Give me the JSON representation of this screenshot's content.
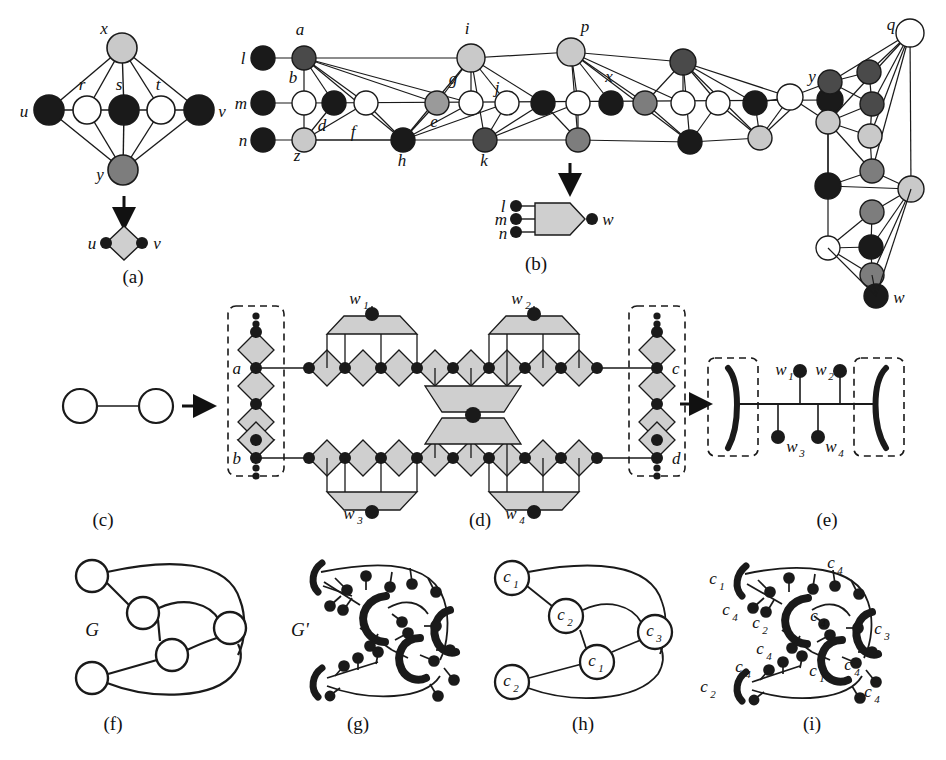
{
  "figure": {
    "background": "#ffffff",
    "width": 946,
    "height": 760
  },
  "palette": {
    "black": "#1a1a1a",
    "dark_gray": "#4a4a4a",
    "mid_gray": "#7d7d7d",
    "light_gray": "#c9c9c9",
    "pale_gray": "#d8d8d8",
    "white": "#ffffff",
    "stroke": "#1a1a1a",
    "gadget_fill": "#cfcfcf"
  },
  "panels": [
    {
      "id": "a",
      "label": "(a)",
      "x": 133,
      "y": 262
    },
    {
      "id": "b",
      "label": "(b)",
      "x": 536,
      "y": 262
    },
    {
      "id": "c",
      "label": "(c)",
      "x": 103,
      "y": 519
    },
    {
      "id": "d",
      "label": "(d)",
      "x": 480,
      "y": 519
    },
    {
      "id": "e",
      "label": "(e)",
      "x": 827,
      "y": 519
    },
    {
      "id": "f",
      "label": "(f)",
      "x": 113,
      "y": 723
    },
    {
      "id": "g",
      "label": "(g)",
      "x": 358,
      "y": 723
    },
    {
      "id": "h",
      "label": "(h)",
      "x": 583,
      "y": 723
    },
    {
      "id": "i",
      "label": "(i)",
      "x": 812,
      "y": 723
    }
  ],
  "panel_a": {
    "caption": "(a)",
    "nodes": [
      {
        "name": "x",
        "label": "x",
        "cx": 122,
        "cy": 48,
        "r": 15,
        "fill": "#c9c9c9",
        "label_x": 102,
        "label_y": 32
      },
      {
        "name": "u",
        "label": "u",
        "cx": 49,
        "cy": 110,
        "r": 15,
        "fill": "#1a1a1a",
        "label_x": 22,
        "label_y": 117
      },
      {
        "name": "r",
        "label": "r",
        "cx": 87,
        "cy": 110,
        "r": 14,
        "fill": "#ffffff",
        "label_x": 79,
        "label_y": 88
      },
      {
        "name": "s",
        "label": "s",
        "cx": 124,
        "cy": 110,
        "r": 15,
        "fill": "#1a1a1a",
        "label_x": 116,
        "label_y": 88
      },
      {
        "name": "t",
        "label": "t",
        "cx": 161,
        "cy": 110,
        "r": 14,
        "fill": "#ffffff",
        "label_x": 155,
        "label_y": 88
      },
      {
        "name": "v",
        "label": "v",
        "cx": 199,
        "cy": 110,
        "r": 15,
        "fill": "#1a1a1a",
        "label_x": 219,
        "label_y": 117
      },
      {
        "name": "y",
        "label": "y",
        "cx": 123,
        "cy": 170,
        "r": 15,
        "fill": "#7d7d7d",
        "label_x": 98,
        "label_y": 180
      }
    ],
    "arrow": {
      "x": 124,
      "y1": 196,
      "y2": 224
    },
    "result": {
      "left_label": "u",
      "right_label": "v",
      "left_x": 92,
      "right_x": 158,
      "y": 243,
      "diamond_cx": 124,
      "diamond_cy": 243,
      "diamond_r": 17,
      "dot_r": 6
    }
  },
  "panel_b": {
    "caption": "(b)",
    "node_labels": [
      "l",
      "m",
      "n",
      "a",
      "b",
      "d",
      "z",
      "f",
      "e",
      "g",
      "h",
      "i",
      "j",
      "k",
      "x",
      "p",
      "y",
      "q",
      "w"
    ],
    "gadget": {
      "inputs": [
        "l",
        "m",
        "n"
      ],
      "output": "w",
      "input_label_x": 502,
      "output_label": "w",
      "output_label_x": 615
    },
    "arrow": {
      "x": 570,
      "y1": 163,
      "y2": 190
    }
  },
  "panel_c": {
    "caption": "(c)",
    "left_node": {
      "cx": 80,
      "cy": 406,
      "r": 17,
      "fill": "#ffffff"
    },
    "right_node": {
      "cx": 156,
      "cy": 406,
      "r": 17,
      "fill": "#ffffff"
    },
    "arrow": {
      "x1": 180,
      "x2": 210,
      "y": 406
    }
  },
  "panel_d": {
    "caption": "(d)",
    "labels": [
      "a",
      "b",
      "c",
      "d",
      "w1",
      "w2",
      "w3",
      "w4"
    ],
    "label_texts": {
      "a": "a",
      "b": "b",
      "c": "c",
      "d": "d",
      "w1": "w",
      "w1_sub": "1",
      "w2": "w",
      "w2_sub": "2",
      "w3": "w",
      "w3_sub": "3",
      "w4": "w",
      "w4_sub": "4"
    },
    "left_box": {
      "x": 228,
      "y": 306,
      "w": 56,
      "h": 170
    },
    "right_box": {
      "x": 629,
      "y": 306,
      "w": 56,
      "h": 170
    },
    "top_chain_y": 360,
    "bottom_chain_y": 444
  },
  "panel_e": {
    "caption": "(e)",
    "labels": {
      "w1": "w",
      "w1_sub": "1",
      "w2": "w",
      "w2_sub": "2",
      "w3": "w",
      "w3_sub": "3",
      "w4": "w",
      "w4_sub": "4"
    },
    "left_box": {
      "x": 708,
      "y": 358,
      "w": 50,
      "h": 98
    },
    "right_box": {
      "x": 854,
      "y": 358,
      "w": 50,
      "h": 98
    },
    "arrow": {
      "x1": 680,
      "x2": 706,
      "y": 404
    }
  },
  "panel_f": {
    "caption": "(f)",
    "graph_label": "G",
    "graph_label_x": 92,
    "graph_label_y": 636,
    "nodes": [
      {
        "name": "v-top-left",
        "cx": 92,
        "cy": 576,
        "r": 16
      },
      {
        "name": "v-mid-upper",
        "cx": 143,
        "cy": 613,
        "r": 16
      },
      {
        "name": "v-mid-lower",
        "cx": 172,
        "cy": 655,
        "r": 16
      },
      {
        "name": "v-right",
        "cx": 230,
        "cy": 628,
        "r": 16
      },
      {
        "name": "v-bot-left",
        "cx": 92,
        "cy": 678,
        "r": 16
      }
    ]
  },
  "panel_g": {
    "caption": "(g)",
    "graph_label": "G'",
    "graph_label_x": 300,
    "graph_label_y": 636
  },
  "panel_h": {
    "caption": "(h)",
    "nodes": [
      {
        "name": "h-top-left",
        "label": "c",
        "sub": "1",
        "cx": 512,
        "cy": 578,
        "r": 17
      },
      {
        "name": "h-mid-upper",
        "label": "c",
        "sub": "2",
        "cx": 566,
        "cy": 616,
        "r": 17
      },
      {
        "name": "h-mid-lower",
        "label": "c",
        "sub": "1",
        "cx": 597,
        "cy": 662,
        "r": 17
      },
      {
        "name": "h-right",
        "label": "c",
        "sub": "3",
        "cx": 655,
        "cy": 632,
        "r": 17
      },
      {
        "name": "h-bot-left",
        "label": "c",
        "sub": "2",
        "cx": 512,
        "cy": 682,
        "r": 17
      }
    ]
  },
  "panel_i": {
    "caption": "(i)",
    "labels": [
      {
        "name": "i-c1-top",
        "text": "c",
        "sub": "1",
        "x": 716,
        "y": 584
      },
      {
        "name": "i-c4-top",
        "text": "c",
        "sub": "4",
        "x": 834,
        "y": 568
      },
      {
        "name": "i-c4-left",
        "text": "c",
        "sub": "4",
        "x": 729,
        "y": 615
      },
      {
        "name": "i-c2-mid",
        "text": "c",
        "sub": "2",
        "x": 759,
        "y": 628
      },
      {
        "name": "i-c4-center",
        "text": "c",
        "sub": "4",
        "x": 817,
        "y": 621
      },
      {
        "name": "i-c3-right",
        "text": "c",
        "sub": "3",
        "x": 881,
        "y": 634
      },
      {
        "name": "i-c4-mid2",
        "text": "c",
        "sub": "4",
        "x": 763,
        "y": 654
      },
      {
        "name": "i-c4-low",
        "text": "c",
        "sub": "4",
        "x": 742,
        "y": 672
      },
      {
        "name": "i-c1-low",
        "text": "c",
        "sub": "1",
        "x": 816,
        "y": 676
      },
      {
        "name": "i-c4-low2",
        "text": "c",
        "sub": "4",
        "x": 851,
        "y": 670
      },
      {
        "name": "i-c2-bot",
        "text": "c",
        "sub": "2",
        "x": 707,
        "y": 692
      },
      {
        "name": "i-c4-bot",
        "text": "c",
        "sub": "4",
        "x": 871,
        "y": 697
      }
    ]
  }
}
